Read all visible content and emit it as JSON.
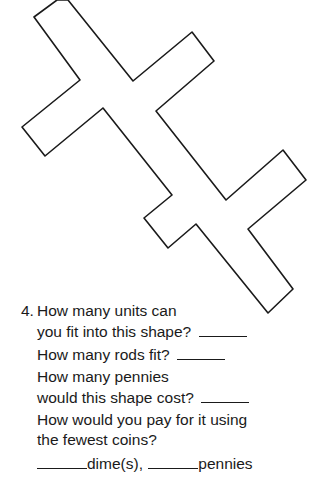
{
  "figure": {
    "label": "shape-outline",
    "points": "34,17 57,0 68,0 133,81 192,32 214,61 156,111 226,200 283,150 306,180 248,229 293,289 268,313 196,224 168,248 144,218 172,195 103,108 45,156 22,127 80,80",
    "stroke": "#1a1a1a"
  },
  "question": {
    "number": "4.",
    "lines": [
      "How many units can",
      "you fit into this shape?",
      "How many rods fit?",
      "How many pennies",
      "would this shape cost?",
      "How would you pay for it using",
      "the fewest coins?",
      "dime(s),",
      "pennies"
    ]
  }
}
